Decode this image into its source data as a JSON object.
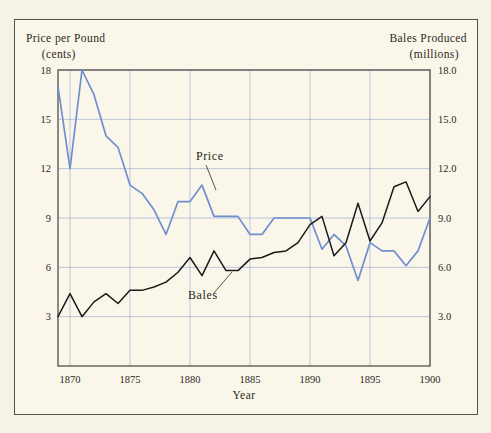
{
  "figure": {
    "background_color": "#f5f2e6",
    "panel_color": "#faf7ea",
    "frame_color": "#55514a"
  },
  "left_axis": {
    "title": "Price per Pound",
    "unit": "(cents)",
    "ticks": [
      "18",
      "15",
      "12",
      "9",
      "6",
      "3"
    ]
  },
  "right_axis": {
    "title": "Bales  Produced",
    "unit": "(millions)",
    "ticks": [
      "18.0",
      "15.0",
      "12.0",
      "9.0",
      "6.0",
      "3.0"
    ]
  },
  "x_axis": {
    "name": "Year",
    "ticks": [
      "1870",
      "1875",
      "1880",
      "1885",
      "1890",
      "1895",
      "1900"
    ]
  },
  "annotations": [
    {
      "label": "Price",
      "series": "price"
    },
    {
      "label": "Bales",
      "series": "bales"
    }
  ],
  "chart_data": {
    "type": "line",
    "title": "",
    "xlabel": "Year",
    "ylabel": "Price per Pound (cents)",
    "y2label": "Bales Produced (millions)",
    "xlim": [
      1869,
      1900
    ],
    "ylim": [
      0,
      18
    ],
    "y2lim": [
      0,
      18
    ],
    "yticks": [
      3,
      6,
      9,
      12,
      15,
      18
    ],
    "y2ticks": [
      3.0,
      6.0,
      9.0,
      12.0,
      15.0,
      18.0
    ],
    "xticks": [
      1870,
      1875,
      1880,
      1885,
      1890,
      1895,
      1900
    ],
    "grid": true,
    "legend_position": "inline-annotation",
    "x": [
      1869,
      1870,
      1871,
      1872,
      1873,
      1874,
      1875,
      1876,
      1877,
      1878,
      1879,
      1880,
      1881,
      1882,
      1883,
      1884,
      1885,
      1886,
      1887,
      1888,
      1889,
      1890,
      1891,
      1892,
      1893,
      1894,
      1895,
      1896,
      1897,
      1898,
      1899,
      1900
    ],
    "series": [
      {
        "name": "Price",
        "axis": "left",
        "color": "#6f8fd0",
        "units": "cents per pound",
        "values": [
          17.0,
          12.0,
          18.0,
          16.5,
          14.0,
          13.3,
          11.0,
          10.5,
          9.5,
          8.0,
          10.0,
          10.0,
          11.0,
          9.1,
          9.1,
          9.1,
          8.0,
          8.0,
          9.0,
          9.0,
          9.0,
          9.0,
          7.1,
          8.0,
          7.3,
          5.2,
          7.5,
          7.0,
          7.0,
          6.1,
          7.0,
          9.0
        ]
      },
      {
        "name": "Bales",
        "axis": "right",
        "color": "#1a1a1a",
        "units": "millions of bales",
        "values": [
          3.0,
          4.4,
          3.0,
          3.9,
          4.4,
          3.8,
          4.6,
          4.6,
          4.8,
          5.1,
          5.7,
          6.6,
          5.5,
          7.0,
          5.8,
          5.8,
          6.5,
          6.6,
          6.9,
          7.0,
          7.5,
          8.6,
          9.1,
          6.7,
          7.5,
          9.9,
          7.6,
          8.7,
          10.9,
          11.2,
          9.4,
          10.3
        ]
      }
    ]
  }
}
